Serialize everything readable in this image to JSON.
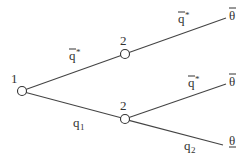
{
  "diagram": {
    "type": "game-tree",
    "nodes": [
      {
        "id": "n1",
        "player": "1",
        "x": 22,
        "y": 91
      },
      {
        "id": "n2-upper",
        "player": "2",
        "x": 125,
        "y": 54
      },
      {
        "id": "n2-lower",
        "player": "2",
        "x": 125,
        "y": 119
      }
    ],
    "edges": [
      {
        "from": "n1",
        "to": "n2-upper",
        "action": "q",
        "action_sup": "*",
        "overbar": true
      },
      {
        "from": "n1",
        "to": "n2-lower",
        "action": "q",
        "action_sub": "1",
        "overbar": false
      },
      {
        "from": "n2-upper",
        "to": "t1",
        "action": "q",
        "action_sup": "*",
        "overbar": true
      },
      {
        "from": "n2-lower",
        "to": "t2",
        "action": "q",
        "action_sup": "*",
        "overbar": true
      },
      {
        "from": "n2-lower",
        "to": "t3",
        "action": "q",
        "action_sub": "2",
        "overbar": false
      }
    ],
    "terminals": [
      {
        "id": "t1",
        "label": "θ",
        "mark": "overbar"
      },
      {
        "id": "t2",
        "label": "θ",
        "mark": "overbar"
      },
      {
        "id": "t3",
        "label": "θ",
        "mark": "underbar"
      }
    ],
    "labels": {
      "player1": "1",
      "player2_upper": "2",
      "player2_lower": "2",
      "edge_upper_1": "q",
      "edge_upper_1_sup": "*",
      "edge_lower_1": "q",
      "edge_lower_1_sub": "1",
      "edge_upper_2": "q",
      "edge_upper_2_sup": "*",
      "edge_mid_2": "q",
      "edge_mid_2_sup": "*",
      "edge_lower_2": "q",
      "edge_lower_2_sub": "2",
      "theta_top": "θ",
      "theta_mid": "θ",
      "theta_bottom": "θ"
    }
  }
}
